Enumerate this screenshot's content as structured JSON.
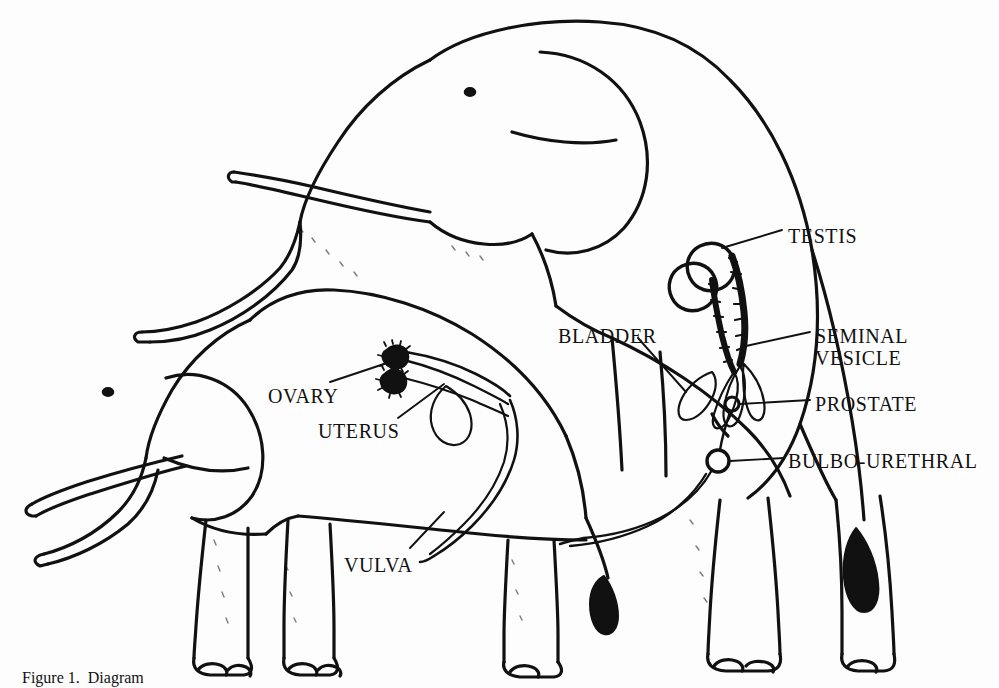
{
  "figure": {
    "style": "hand-drawn black ink line drawing on white",
    "background_color": "#fdfdfd",
    "ink_color": "#111111",
    "caption": "Figure 1.  Diagram",
    "caption_clipped": true
  },
  "labels": [
    {
      "id": "testis",
      "text": "TESTIS",
      "x": 788,
      "y": 225,
      "align": "left"
    },
    {
      "id": "seminal_vesicle",
      "text": "SEMINAL",
      "x": 815,
      "y": 325,
      "align": "left"
    },
    {
      "id": "seminal_vesicle2",
      "text": "VESICLE",
      "x": 815,
      "y": 347,
      "align": "left"
    },
    {
      "id": "prostate",
      "text": "PROSTATE",
      "x": 815,
      "y": 393,
      "align": "left"
    },
    {
      "id": "bulbo_urethral",
      "text": "BULBO-URETHRAL",
      "x": 788,
      "y": 450,
      "align": "left"
    },
    {
      "id": "bladder",
      "text": "BLADDER",
      "x": 558,
      "y": 325,
      "align": "left"
    },
    {
      "id": "ovary",
      "text": "OVARY",
      "x": 268,
      "y": 385,
      "align": "left"
    },
    {
      "id": "uterus",
      "text": "UTERUS",
      "x": 318,
      "y": 420,
      "align": "left"
    },
    {
      "id": "vulva",
      "text": "VULVA",
      "x": 344,
      "y": 554,
      "align": "left"
    }
  ],
  "structures": {
    "male": [
      {
        "name": "testis",
        "count": 2,
        "shape": "rounded ovals"
      },
      {
        "name": "epididymis",
        "count": 2,
        "shape": "dark crinkled ducts"
      },
      {
        "name": "seminal-vesicle",
        "count": 3,
        "shape": "leaf-shaped lobes"
      },
      {
        "name": "bladder",
        "count": 1,
        "shape": "leaf-shaped lobe"
      },
      {
        "name": "prostate",
        "count": 1,
        "shape": "small circle"
      },
      {
        "name": "bulbo-urethral",
        "count": 1,
        "shape": "larger circle"
      },
      {
        "name": "urethra",
        "count": 1,
        "shape": "long curving duct"
      }
    ],
    "female": [
      {
        "name": "ovary",
        "count": 2,
        "shape": "small dark knobs"
      },
      {
        "name": "oviduct",
        "count": 2,
        "shape": "thin tubes"
      },
      {
        "name": "uterus",
        "count": 1,
        "shape": "looped horn"
      },
      {
        "name": "vagina",
        "count": 1,
        "shape": "long curving canal"
      },
      {
        "name": "vulva",
        "count": 1,
        "shape": "terminal opening"
      }
    ]
  },
  "animals": [
    {
      "id": "male",
      "role": "mounting elephant",
      "position": "rear, upper-right"
    },
    {
      "id": "female",
      "role": "mounted elephant",
      "position": "front, lower-left"
    }
  ]
}
